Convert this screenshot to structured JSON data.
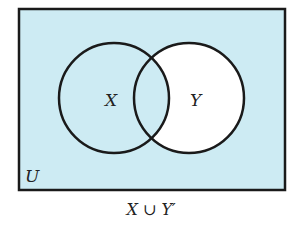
{
  "diagram": {
    "type": "venn",
    "universe_label": "U",
    "sets": [
      {
        "label": "X",
        "shaded": true
      },
      {
        "label": "Y",
        "shaded_only_in_intersection": true
      }
    ],
    "caption": "X ∪ Y′",
    "colors": {
      "shade": "#cdebf3",
      "outline": "#1a1a1a",
      "unshaded": "#ffffff"
    }
  }
}
